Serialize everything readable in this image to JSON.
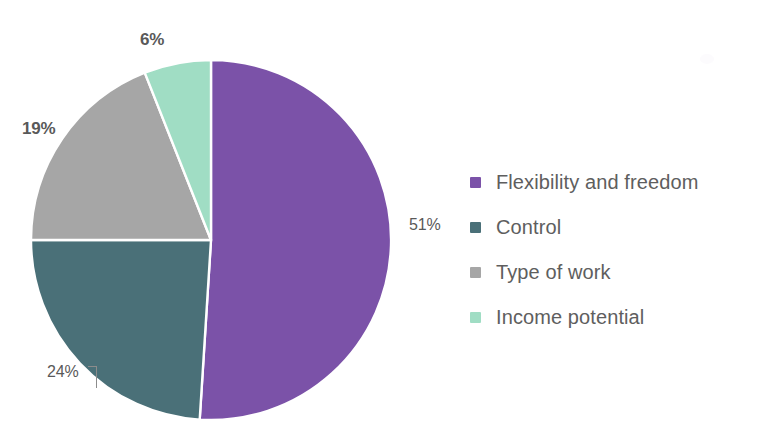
{
  "chart_data": {
    "type": "pie",
    "title": "",
    "categories": [
      "Flexibility and freedom",
      "Control",
      "Type of work",
      "Income potential"
    ],
    "values": [
      51,
      24,
      19,
      6
    ],
    "value_unit": "%",
    "data_labels": [
      "51%",
      "24%",
      "19%",
      "6%"
    ],
    "colors": [
      "#7B52A8",
      "#4A7078",
      "#A6A6A6",
      "#A0DDC4"
    ],
    "legend_position": "right",
    "start_angle_deg": 0,
    "direction": "clockwise",
    "grid": false,
    "slices": [
      {
        "label": "Flexibility and freedom",
        "value": 51,
        "data_label": "51%",
        "color": "#7B52A8"
      },
      {
        "label": "Control",
        "value": 24,
        "data_label": "24%",
        "color": "#4A7078"
      },
      {
        "label": "Type of work",
        "value": 19,
        "data_label": "19%",
        "color": "#A6A6A6"
      },
      {
        "label": "Income potential",
        "value": 6,
        "data_label": "6%",
        "color": "#A0DDC4"
      }
    ]
  },
  "labels": {
    "top": "6%",
    "left": "19%",
    "right": "51%",
    "bottom": "24%"
  },
  "legend": {
    "items": [
      {
        "label": "Flexibility and freedom",
        "color": "#7B52A8"
      },
      {
        "label": "Control",
        "color": "#4A7078"
      },
      {
        "label": "Type of work",
        "color": "#A6A6A6"
      },
      {
        "label": "Income potential",
        "color": "#A0DDC4"
      }
    ]
  },
  "style": {
    "background": "#ffffff",
    "label_color": "#595959",
    "legend_text_color": "#5e5e5e",
    "slice_separator": "#ffffff"
  }
}
